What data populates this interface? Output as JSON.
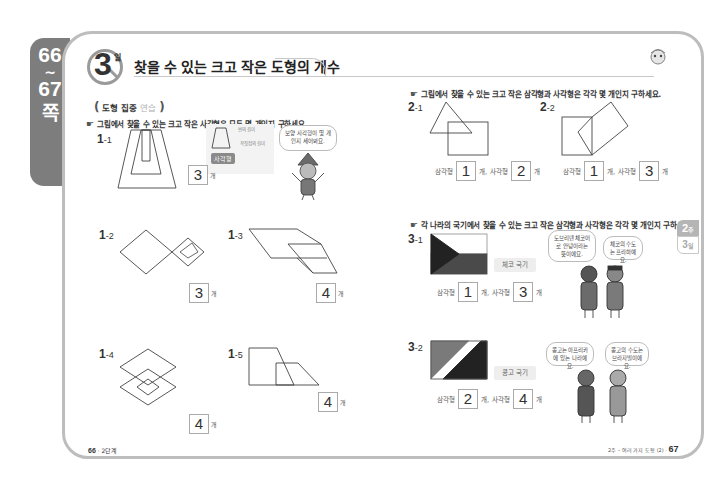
{
  "page_tab": {
    "start_page": "66",
    "tilde": "~",
    "end_page": "67",
    "suffix": "쪽"
  },
  "header": {
    "day_number": "3",
    "day_label": "일",
    "title": "찾을 수 있는 크고 작은 도형의 개수"
  },
  "section": {
    "label_main": "도형 집중",
    "label_accent": "연습"
  },
  "left": {
    "instruction": "그림에서 찾을 수 있는 크고 작은 사각형은 모두 몇 개인지 구하세요.",
    "hint": {
      "note_top": "변의 길이",
      "note_bottom": "꼭짓점의 길이",
      "tag": "사각형",
      "bubble": "보양 사각형이 몇 개인지 세어봐요."
    },
    "questions": [
      {
        "num": "1",
        "sub": "-1",
        "answer": "3",
        "unit": "개"
      },
      {
        "num": "1",
        "sub": "-2",
        "answer": "3",
        "unit": "개"
      },
      {
        "num": "1",
        "sub": "-3",
        "answer": "4",
        "unit": "개"
      },
      {
        "num": "1",
        "sub": "-4",
        "answer": "4",
        "unit": "개"
      },
      {
        "num": "1",
        "sub": "-5",
        "answer": "4",
        "unit": "개"
      }
    ]
  },
  "right": {
    "instruction_2": "그림에서 찾을 수 있는 크고 작은 삼각형과 사각형은 각각 몇 개인지 구하세요.",
    "instruction_3": "각 나라의 국기에서 찾을 수 있는 크고 작은 삼각형과 사각형은 각각 몇 개인지 구하세요.",
    "labels": {
      "triangle": "삼각형",
      "square": "사각형",
      "unit": "개",
      "unit_comma": "개,"
    },
    "questions_2": [
      {
        "num": "2",
        "sub": "-1",
        "triangles": "1",
        "squares": "2"
      },
      {
        "num": "2",
        "sub": "-2",
        "triangles": "1",
        "squares": "3"
      }
    ],
    "questions_3": [
      {
        "num": "3",
        "sub": "-1",
        "flag_name": "체코 국기",
        "triangles": "1",
        "squares": "3",
        "bubble_left": "도브리덴 체코어로 안녕이라는 뜻이에요.",
        "bubble_right": "체코의 수도는 프라하예요."
      },
      {
        "num": "3",
        "sub": "-2",
        "flag_name": "콩고 국기",
        "triangles": "2",
        "squares": "4",
        "bubble_left": "콩고는 아프리카에 있는 나라예요.",
        "bubble_right": "콩고의 수도는 브라자빌이에요."
      }
    ]
  },
  "side_tab": {
    "week": "2",
    "week_label": "주",
    "day": "3",
    "day_label": "일"
  },
  "footer": {
    "left_page": "66",
    "left_text": "· 2단계",
    "right_text": "2주 – 여러 가지 도형 (2) ·",
    "right_page": "67"
  },
  "colors": {
    "tab_gray": "#7d7d7d",
    "frame_border": "#bdbdbd",
    "flag_red_gray": "#6e6e6e",
    "flag_dark": "#222222"
  }
}
